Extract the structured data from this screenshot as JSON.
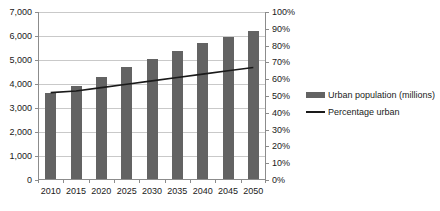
{
  "chart_data": {
    "type": "bar",
    "title": "",
    "subtitle": "",
    "xlabel": "",
    "ylabel": "",
    "grid": true,
    "legend_position": "right",
    "categories": [
      "2010",
      "2015",
      "2020",
      "2025",
      "2030",
      "2035",
      "2040",
      "2045",
      "2050"
    ],
    "series": [
      {
        "name": "Urban population (millions)",
        "type": "bar",
        "axis": "left",
        "color": "#636363",
        "values": [
          3600,
          3880,
          4250,
          4670,
          5000,
          5350,
          5670,
          5930,
          6180
        ]
      },
      {
        "name": "Percentage urban",
        "type": "line",
        "axis": "right",
        "color": "#1a1a1a",
        "values": [
          52,
          53,
          55,
          57,
          59,
          61,
          63,
          65,
          67
        ]
      }
    ],
    "y_left": {
      "label": "",
      "min": 0,
      "max": 7000,
      "step": 1000,
      "ticks": [
        "0",
        "1,000",
        "2,000",
        "3,000",
        "4,000",
        "5,000",
        "6,000",
        "7,000"
      ]
    },
    "y_right": {
      "label": "",
      "min": 0,
      "max": 100,
      "step": 10,
      "ticks": [
        "0%",
        "10%",
        "20%",
        "30%",
        "40%",
        "50%",
        "60%",
        "70%",
        "80%",
        "90%",
        "100%"
      ]
    },
    "legend": [
      {
        "label": "Urban population (millions)",
        "marker": "bar-swatch",
        "color": "#636363"
      },
      {
        "label": "Percentage urban",
        "marker": "line-swatch",
        "color": "#1a1a1a"
      }
    ]
  }
}
